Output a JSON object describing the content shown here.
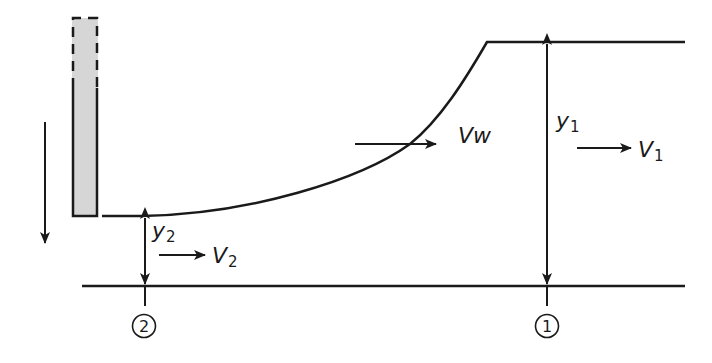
{
  "diagram": {
    "type": "hydraulic-jump / sluice gate flow profile",
    "colors": {
      "line": "#1a1a1a",
      "gate_fill": "#d6d6d6",
      "background": "#ffffff"
    },
    "labels": {
      "vw": "Vw",
      "y1_main": "y",
      "y1_sub": "1",
      "v1_main": "V",
      "v1_sub": "1",
      "y2_main": "y",
      "y2_sub": "2",
      "v2_main": "V",
      "v2_sub": "2",
      "section1": "1",
      "section2": "2"
    },
    "elements": [
      {
        "name": "sluice-gate",
        "style": "shaded, dashed top portion"
      },
      {
        "name": "gate-motion-arrow",
        "direction": "down"
      },
      {
        "name": "water-surface",
        "shape": "curve rising from section 2 to section 1"
      },
      {
        "name": "channel-bed",
        "shape": "horizontal line"
      },
      {
        "name": "wave-velocity-arrow",
        "label": "Vw",
        "direction": "right"
      },
      {
        "name": "depth-y1",
        "style": "double-headed arrow"
      },
      {
        "name": "depth-y2",
        "style": "double-headed arrow"
      },
      {
        "name": "velocity-v1",
        "direction": "right"
      },
      {
        "name": "velocity-v2",
        "direction": "right"
      }
    ]
  }
}
